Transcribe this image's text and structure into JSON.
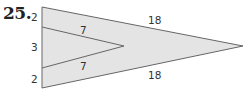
{
  "problem": {
    "number": "25."
  },
  "figure": {
    "fill_color": "#e4e4e4",
    "stroke_color": "#666666",
    "labels": {
      "left_top": "2",
      "left_middle": "3",
      "left_bottom": "2",
      "inner_top": "7",
      "inner_bottom": "7",
      "outer_top": "18",
      "outer_bottom": "18"
    }
  }
}
